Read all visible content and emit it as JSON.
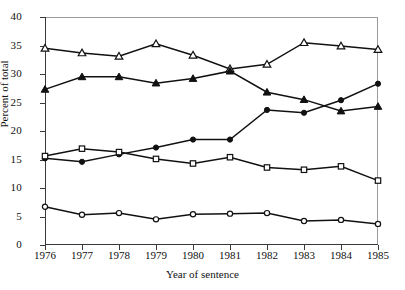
{
  "chart_data": {
    "type": "line",
    "title": "",
    "xlabel": "Year of sentence",
    "ylabel": "Percent of total",
    "categories": [
      "1976",
      "1977",
      "1978",
      "1979",
      "1980",
      "1981",
      "1982",
      "1983",
      "1984",
      "1985"
    ],
    "x": [
      1976,
      1977,
      1978,
      1979,
      1980,
      1981,
      1982,
      1983,
      1984,
      1985
    ],
    "xlim": [
      1976,
      1985
    ],
    "ylim": [
      0,
      40
    ],
    "yticks": [
      0,
      5,
      10,
      15,
      20,
      25,
      30,
      35,
      40
    ],
    "xticks": [
      1976,
      1977,
      1978,
      1979,
      1980,
      1981,
      1982,
      1983,
      1984,
      1985
    ],
    "grid": false,
    "legend": "none",
    "series": [
      {
        "name": "open-triangle-series",
        "marker": "open-triangle",
        "values": [
          34.5,
          33.7,
          33.1,
          35.3,
          33.3,
          30.9,
          31.7,
          35.5,
          34.9,
          34.3
        ]
      },
      {
        "name": "filled-triangle-series",
        "marker": "filled-triangle",
        "values": [
          27.3,
          29.5,
          29.5,
          28.4,
          29.2,
          30.5,
          26.8,
          25.5,
          23.5,
          24.3
        ]
      },
      {
        "name": "filled-circle-series",
        "marker": "filled-circle",
        "values": [
          15.2,
          14.6,
          15.9,
          17.1,
          18.5,
          18.5,
          23.7,
          23.2,
          25.4,
          28.3
        ]
      },
      {
        "name": "open-square-series",
        "marker": "open-square",
        "values": [
          15.6,
          16.9,
          16.3,
          15.1,
          14.3,
          15.4,
          13.6,
          13.2,
          13.8,
          11.3
        ]
      },
      {
        "name": "open-circle-series",
        "marker": "open-circle",
        "values": [
          6.7,
          5.3,
          5.6,
          4.5,
          5.4,
          5.5,
          5.6,
          4.2,
          4.4,
          3.7
        ]
      }
    ]
  }
}
